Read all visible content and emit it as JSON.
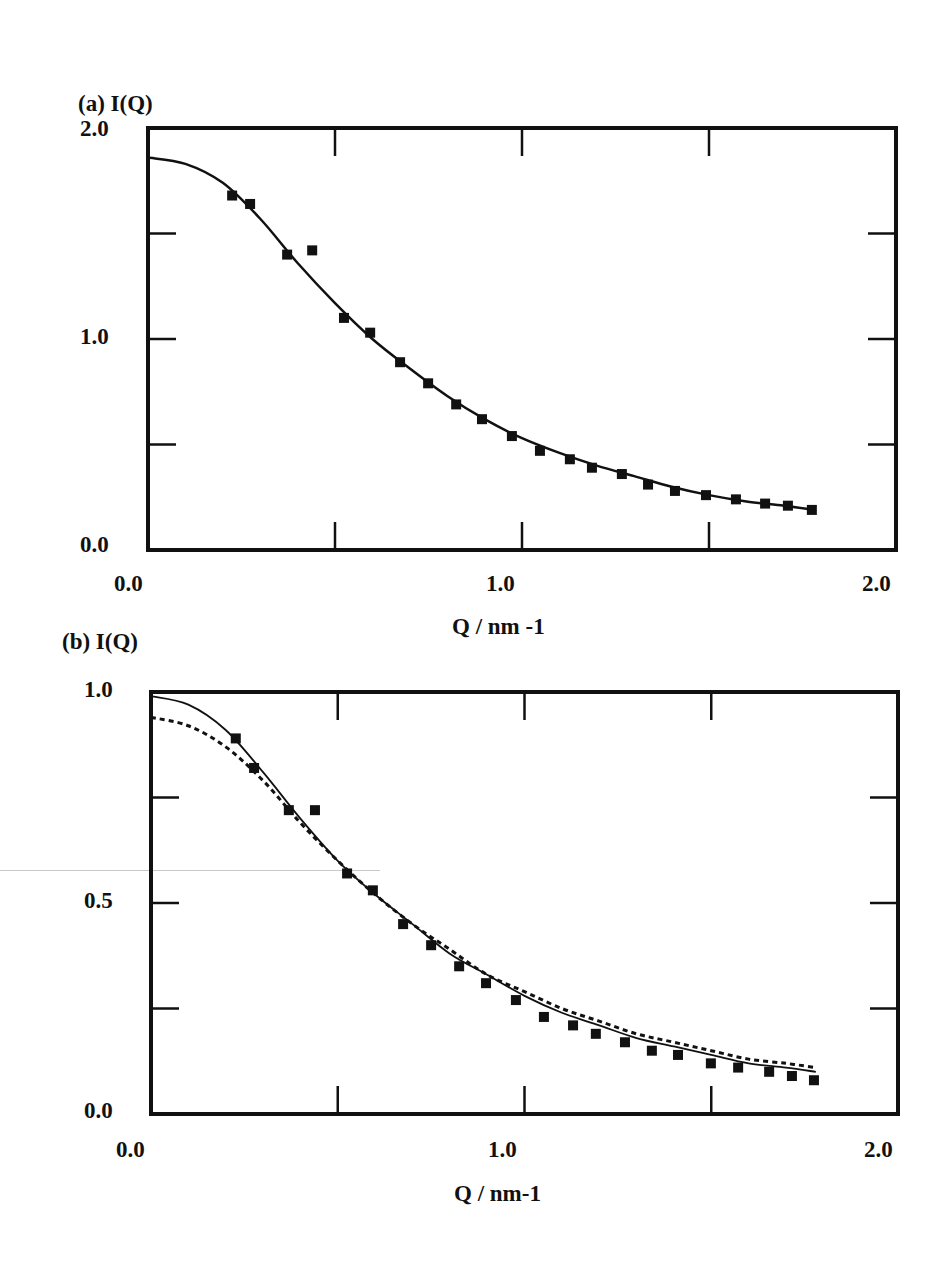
{
  "chart_data": [
    {
      "id": "a",
      "type": "scatter",
      "panel_label": "(a)",
      "title": "",
      "ylabel": "I(Q)",
      "xlabel": "Q / nm -1",
      "xlim": [
        0.0,
        2.0
      ],
      "ylim": [
        0.0,
        2.0
      ],
      "x_tick_labels": [
        "0.0",
        "1.0",
        "2.0"
      ],
      "y_tick_labels": [
        "0.0",
        "1.0",
        "2.0"
      ],
      "x_minor_ticks": [
        0.5,
        1.0,
        1.5
      ],
      "y_minor_ticks": [
        0.5,
        1.0,
        1.5
      ],
      "grid": false,
      "legend": null,
      "series": [
        {
          "name": "data",
          "style": "filled-square-markers",
          "x": [
            0.225,
            0.273,
            0.372,
            0.439,
            0.524,
            0.594,
            0.674,
            0.749,
            0.824,
            0.893,
            0.973,
            1.048,
            1.128,
            1.187,
            1.267,
            1.337,
            1.409,
            1.492,
            1.572,
            1.65,
            1.711,
            1.775
          ],
          "y": [
            1.68,
            1.64,
            1.4,
            1.42,
            1.1,
            1.03,
            0.89,
            0.79,
            0.69,
            0.62,
            0.54,
            0.47,
            0.43,
            0.39,
            0.36,
            0.31,
            0.28,
            0.26,
            0.24,
            0.22,
            0.21,
            0.19
          ]
        },
        {
          "name": "fit",
          "style": "solid-line",
          "x": [
            0.0,
            0.1,
            0.2,
            0.3,
            0.4,
            0.5,
            0.6,
            0.7,
            0.8,
            0.9,
            1.0,
            1.1,
            1.2,
            1.3,
            1.4,
            1.5,
            1.6,
            1.7,
            1.78
          ],
          "y": [
            1.86,
            1.83,
            1.74,
            1.57,
            1.36,
            1.17,
            1.0,
            0.86,
            0.73,
            0.62,
            0.53,
            0.46,
            0.4,
            0.35,
            0.3,
            0.26,
            0.23,
            0.21,
            0.19
          ]
        }
      ]
    },
    {
      "id": "b",
      "type": "scatter",
      "panel_label": "(b)",
      "title": "",
      "ylabel": "I(Q)",
      "xlabel": "Q / nm-1",
      "xlim": [
        0.0,
        2.0
      ],
      "ylim": [
        0.0,
        1.0
      ],
      "x_tick_labels": [
        "0.0",
        "1.0",
        "2.0"
      ],
      "y_tick_labels": [
        "0.0",
        "0.5",
        "1.0"
      ],
      "x_minor_ticks": [
        0.5,
        1.0,
        1.5
      ],
      "y_minor_ticks": [
        0.25,
        0.5,
        0.75
      ],
      "grid": false,
      "legend": null,
      "series": [
        {
          "name": "data",
          "style": "filled-square-markers",
          "x": [
            0.227,
            0.276,
            0.369,
            0.439,
            0.525,
            0.594,
            0.675,
            0.75,
            0.825,
            0.897,
            0.977,
            1.052,
            1.13,
            1.191,
            1.269,
            1.341,
            1.411,
            1.499,
            1.572,
            1.655,
            1.716,
            1.775
          ],
          "y": [
            0.89,
            0.82,
            0.72,
            0.72,
            0.57,
            0.53,
            0.45,
            0.4,
            0.35,
            0.31,
            0.27,
            0.23,
            0.21,
            0.19,
            0.17,
            0.15,
            0.14,
            0.12,
            0.11,
            0.1,
            0.09,
            0.08
          ]
        },
        {
          "name": "fit-solid",
          "style": "solid-line",
          "x": [
            0.0,
            0.1,
            0.2,
            0.3,
            0.4,
            0.5,
            0.6,
            0.7,
            0.8,
            0.9,
            1.0,
            1.1,
            1.2,
            1.3,
            1.4,
            1.5,
            1.6,
            1.7,
            1.78
          ],
          "y": [
            0.99,
            0.97,
            0.91,
            0.81,
            0.7,
            0.6,
            0.52,
            0.45,
            0.38,
            0.33,
            0.28,
            0.24,
            0.21,
            0.18,
            0.16,
            0.14,
            0.12,
            0.11,
            0.1
          ]
        },
        {
          "name": "fit-dashed",
          "style": "dashed-line",
          "x": [
            0.0,
            0.1,
            0.2,
            0.3,
            0.4,
            0.5,
            0.6,
            0.7,
            0.8,
            0.9,
            1.0,
            1.1,
            1.2,
            1.3,
            1.4,
            1.5,
            1.6,
            1.7,
            1.78
          ],
          "y": [
            0.94,
            0.92,
            0.87,
            0.79,
            0.69,
            0.6,
            0.52,
            0.45,
            0.39,
            0.33,
            0.29,
            0.25,
            0.22,
            0.19,
            0.17,
            0.15,
            0.13,
            0.12,
            0.11
          ]
        }
      ]
    }
  ],
  "panels": {
    "a": {
      "label": "(a)  I(Q)",
      "y_top": "2.0",
      "y_mid": "1.0",
      "y_bot": "0.0",
      "x_left": "0.0",
      "x_mid": "1.0",
      "x_right": "2.0",
      "xlabel": "Q / nm -1"
    },
    "b": {
      "label": "(b)  I(Q)",
      "y_top": "1.0",
      "y_mid": "0.5",
      "y_bot": "0.0",
      "x_left": "0.0",
      "x_mid": "1.0",
      "x_right": "2.0",
      "xlabel": "Q / nm-1"
    }
  },
  "colors": {
    "ink": "#111111",
    "background": "#ffffff",
    "scan_artifact": "#c8c8c8"
  }
}
